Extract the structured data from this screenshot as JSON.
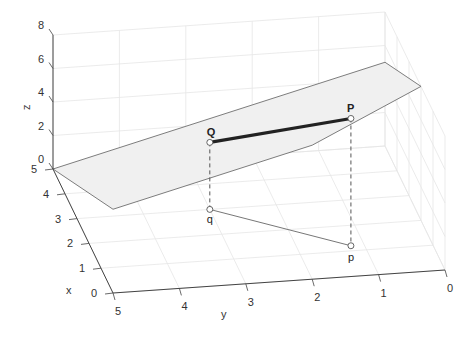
{
  "chart_data": {
    "type": "3d-line",
    "title": "",
    "xlabel": "x",
    "ylabel": "y",
    "zlabel": "z",
    "xlim": [
      0,
      5
    ],
    "ylim": [
      0,
      5
    ],
    "zlim": [
      0,
      8
    ],
    "xticks": [
      "0",
      "1",
      "2",
      "3",
      "4",
      "5"
    ],
    "yticks": [
      "0",
      "1",
      "2",
      "3",
      "4",
      "5"
    ],
    "zticks": [
      "0",
      "2",
      "4",
      "6",
      "8"
    ],
    "grid": true,
    "plane": {
      "equation": "z = 10 - x - y",
      "vertices": [
        [
          5,
          5,
          0
        ],
        [
          0,
          5,
          5
        ],
        [
          0,
          2,
          8
        ],
        [
          2,
          0,
          8
        ],
        [
          5,
          0,
          5
        ]
      ],
      "color": "#f0f0f0"
    },
    "points": [
      {
        "name": "q",
        "label": "q",
        "coords": [
          3,
          3,
          0
        ]
      },
      {
        "name": "p",
        "label": "p",
        "coords": [
          1.2,
          1.2,
          0
        ]
      },
      {
        "name": "Q",
        "label": "Q",
        "coords": [
          3,
          3,
          4
        ]
      },
      {
        "name": "P",
        "label": "P",
        "coords": [
          1.2,
          1.2,
          7.6
        ]
      }
    ],
    "segments": [
      {
        "name": "PQ",
        "from": "Q",
        "to": "P",
        "style": "thick",
        "color": "#222222"
      },
      {
        "name": "pq",
        "from": "q",
        "to": "p",
        "style": "thin",
        "color": "#777777"
      },
      {
        "name": "Qq",
        "from": "Q",
        "to": "q",
        "style": "dashed",
        "color": "#555555"
      },
      {
        "name": "Pp",
        "from": "P",
        "to": "p",
        "style": "dashed",
        "color": "#555555"
      }
    ]
  }
}
